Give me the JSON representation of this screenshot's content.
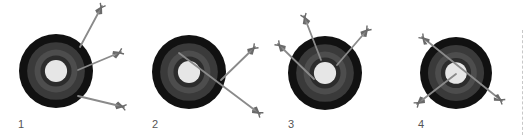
{
  "colors": {
    "background": "#ffffff",
    "ring_outer": "#111111",
    "ring_2": "#3a3a3a",
    "ring_3": "#4d4d4d",
    "ring_4": "#2c2c2c",
    "bullseye": "#e6e6e6",
    "shaft": "#8a8a8a",
    "fletch": "#6a6a6a",
    "label": "#555555"
  },
  "targets": [
    {
      "label": "1",
      "cx": 56,
      "cy": 71,
      "r": 37,
      "label_x": 18,
      "label_y": 119,
      "arrows": [
        {
          "tip": [
            80,
            47
          ],
          "tail": [
            102,
            6
          ]
        },
        {
          "tip": [
            78,
            70
          ],
          "tail": [
            121,
            52
          ]
        },
        {
          "tip": [
            78,
            96
          ],
          "tail": [
            124,
            107
          ]
        }
      ]
    },
    {
      "label": "2",
      "cx": 189,
      "cy": 72,
      "r": 37,
      "label_x": 152,
      "label_y": 119,
      "arrows": [
        {
          "tip": [
            179,
            53
          ],
          "tail": [
            260,
            114
          ]
        },
        {
          "tip": [
            221,
            80
          ],
          "tail": [
            255,
            47
          ]
        }
      ]
    },
    {
      "label": "3",
      "cx": 325,
      "cy": 73,
      "r": 37,
      "label_x": 288,
      "label_y": 119,
      "arrows": [
        {
          "tip": [
            321,
            60
          ],
          "tail": [
            304,
            16
          ]
        },
        {
          "tip": [
            337,
            65
          ],
          "tail": [
            368,
            29
          ]
        },
        {
          "tip": [
            314,
            79
          ],
          "tail": [
            278,
            44
          ]
        }
      ]
    },
    {
      "label": "4",
      "cx": 456,
      "cy": 73,
      "r": 36,
      "label_x": 418,
      "label_y": 119,
      "arrows": [
        {
          "tip": [
            455,
            72
          ],
          "tail": [
            422,
            37
          ],
          "extend_to": [
            502,
            101
          ]
        },
        {
          "tip": [
            456,
            74
          ],
          "tail": [
            417,
            104
          ]
        }
      ]
    }
  ]
}
